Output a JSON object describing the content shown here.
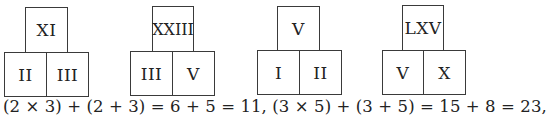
{
  "figure": {
    "groups": [
      {
        "top": "XI",
        "left": "II",
        "right": "III"
      },
      {
        "top": "XXIII",
        "left": "III",
        "right": "V"
      },
      {
        "top": "V",
        "left": "I",
        "right": "II"
      },
      {
        "top": "LXV",
        "left": "V",
        "right": "X"
      }
    ],
    "equation": "(2 × 3) + (2 + 3) = 6 + 5 = 11, (3 × 5) + (3 + 5) = 15 + 8 = 23,"
  }
}
